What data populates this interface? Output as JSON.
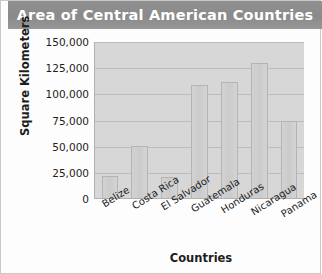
{
  "chart_data": {
    "type": "bar",
    "title": "Area of Central American Countries",
    "xlabel": "Countries",
    "ylabel": "Square Kilometers",
    "categories": [
      "Belize",
      "Costa Rica",
      "El Salvador",
      "Guatemala",
      "Honduras",
      "Nicaragua",
      "Panama"
    ],
    "values": [
      22000,
      51000,
      21000,
      109000,
      112000,
      130000,
      75000
    ],
    "ylim": [
      0,
      150000
    ],
    "ytick_values": [
      0,
      25000,
      50000,
      75000,
      100000,
      125000,
      150000
    ],
    "ytick_labels": [
      "0",
      "25,000",
      "50,000",
      "75,000",
      "100,000",
      "125,000",
      "150,000"
    ],
    "grid": true,
    "legend": false,
    "colors": {
      "title_bar": "#8e8e8e",
      "title_text": "#ffffff",
      "plot_background": "#d7d7d7",
      "bar_fill": "#cfcfcf",
      "bar_border": "#b4b4b4",
      "gridline": "#bdbdbd",
      "axis_text": "#1d1d1d"
    }
  }
}
